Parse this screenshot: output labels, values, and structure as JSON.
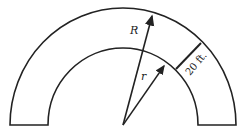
{
  "diagram": {
    "type": "semicircular annulus with radii",
    "labels": {
      "outer_radius": "R",
      "inner_radius": "r",
      "width": "20 ft."
    },
    "colors": {
      "stroke": "#222222",
      "background": "#ffffff"
    }
  }
}
